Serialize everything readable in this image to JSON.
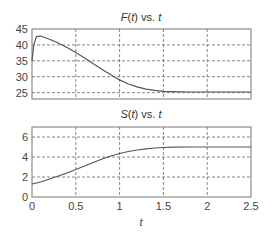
{
  "chart_data": [
    {
      "type": "line",
      "title": "F(t) vs. t",
      "title_parts": {
        "fn": "F",
        "arg": "t",
        "sep": " vs. ",
        "var": "t"
      },
      "xlabel": "",
      "ylabel": "",
      "xlim": [
        0,
        2.5
      ],
      "ylim": [
        23,
        45
      ],
      "grid": true,
      "x_ticks": [
        0,
        0.5,
        1,
        1.5,
        2,
        2.5
      ],
      "y_ticks": [
        "25",
        "30",
        "35",
        "40",
        "45"
      ],
      "y_tick_values": [
        25,
        30,
        35,
        40,
        45
      ],
      "series": [
        {
          "name": "F(t)",
          "x": [
            0,
            0.02,
            0.05,
            0.1,
            0.2,
            0.3,
            0.4,
            0.5,
            0.6,
            0.7,
            0.8,
            0.9,
            1.0,
            1.1,
            1.2,
            1.3,
            1.4,
            1.5,
            1.6,
            1.8,
            2.0,
            2.5
          ],
          "values": [
            35,
            40,
            42.6,
            42.8,
            41.8,
            40.6,
            39.2,
            37.6,
            35.9,
            34.1,
            32.3,
            30.6,
            29.0,
            27.7,
            26.8,
            26.1,
            25.7,
            25.4,
            25.3,
            25.2,
            25.2,
            25.2
          ]
        }
      ]
    },
    {
      "type": "line",
      "title": "S(t) vs. t",
      "title_parts": {
        "fn": "S",
        "arg": "t",
        "sep": " vs. ",
        "var": "t"
      },
      "xlabel": "t",
      "ylabel": "",
      "xlim": [
        0,
        2.5
      ],
      "ylim": [
        0,
        7
      ],
      "grid": true,
      "x_ticks": [
        "0",
        "0.5",
        "1",
        "1.5",
        "2",
        "2.5"
      ],
      "x_tick_values": [
        0,
        0.5,
        1,
        1.5,
        2,
        2.5
      ],
      "y_ticks": [
        "0",
        "2",
        "4",
        "6"
      ],
      "y_tick_values": [
        0,
        2,
        4,
        6
      ],
      "series": [
        {
          "name": "S(t)",
          "x": [
            0,
            0.1,
            0.2,
            0.3,
            0.4,
            0.5,
            0.6,
            0.7,
            0.8,
            0.9,
            1.0,
            1.1,
            1.2,
            1.3,
            1.4,
            1.5,
            1.6,
            1.8,
            2.0,
            2.5
          ],
          "values": [
            1.3,
            1.5,
            1.8,
            2.1,
            2.4,
            2.75,
            3.1,
            3.45,
            3.8,
            4.1,
            4.35,
            4.55,
            4.7,
            4.82,
            4.9,
            4.95,
            4.98,
            5.0,
            5.0,
            5.0
          ]
        }
      ]
    }
  ]
}
